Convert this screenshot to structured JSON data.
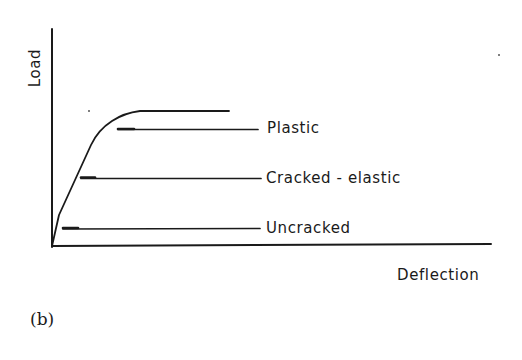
{
  "figure": {
    "caption": "(b)",
    "axes": {
      "x_label": "Deflection",
      "y_label": "Load"
    },
    "curve_description": "Load-deflection curve: steep initial uncracked branch, reduced-stiffness cracked-elastic branch, rounding into a horizontal plastic plateau",
    "levels": [
      {
        "label": "Plastic"
      },
      {
        "label": "Cracked - elastic"
      },
      {
        "label": "Uncracked"
      }
    ],
    "colors": {
      "ink": "#1a1a1a",
      "background": "#ffffff"
    }
  }
}
